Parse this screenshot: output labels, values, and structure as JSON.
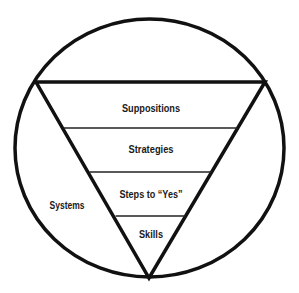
{
  "diagram": {
    "outer_label": "Systems",
    "layers": [
      {
        "label": "Suppositions"
      },
      {
        "label": "Strategies"
      },
      {
        "label": "Steps to “Yes”"
      },
      {
        "label": "Skills"
      }
    ],
    "stroke_color": "#111111",
    "background": "#ffffff"
  }
}
